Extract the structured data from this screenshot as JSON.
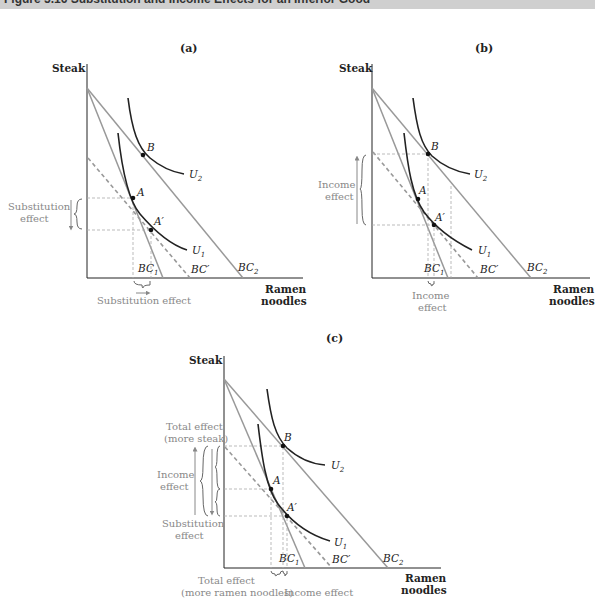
{
  "header": {
    "title": "Figure 5.16    Substitution and Income Effects for an Inferior Good"
  },
  "panels": [
    {
      "id": "a",
      "label": "(a)",
      "y_axis": "Steak",
      "x_axis": [
        "Ramen",
        "noodles"
      ],
      "points": [
        "B",
        "A",
        "A′"
      ],
      "curves": [
        "U2",
        "U1"
      ],
      "lines": [
        "BC1",
        "BC′",
        "BC2"
      ],
      "annotations": {
        "left": [
          "Substitution",
          "effect"
        ],
        "bottom": [
          "Substitution effect"
        ]
      }
    },
    {
      "id": "b",
      "label": "(b)",
      "y_axis": "Steak",
      "x_axis": [
        "Ramen",
        "noodles"
      ],
      "points": [
        "B",
        "A",
        "A′"
      ],
      "curves": [
        "U2",
        "U1"
      ],
      "lines": [
        "BC1",
        "BC′",
        "BC2"
      ],
      "annotations": {
        "left": [
          "Income",
          "effect"
        ],
        "bottom": [
          "Income",
          "effect"
        ]
      }
    },
    {
      "id": "c",
      "label": "(c)",
      "y_axis": "Steak",
      "x_axis": [
        "Ramen",
        "noodles"
      ],
      "points": [
        "B",
        "A",
        "A′"
      ],
      "curves": [
        "U2",
        "U1"
      ],
      "lines": [
        "BC1",
        "BC′",
        "BC2"
      ],
      "annotations": {
        "left_top": [
          "Total effect",
          "(more steak)"
        ],
        "left_mid": [
          "Income",
          "effect"
        ],
        "left_bot": [
          "Substitution",
          "effect"
        ],
        "bottom_left": [
          "Total effect",
          "(more ramen noodles)"
        ],
        "bottom_right": [
          "Income effect"
        ]
      }
    }
  ],
  "colors": {
    "curve": "#222222",
    "budget": "#999999",
    "annot": "#888888"
  }
}
